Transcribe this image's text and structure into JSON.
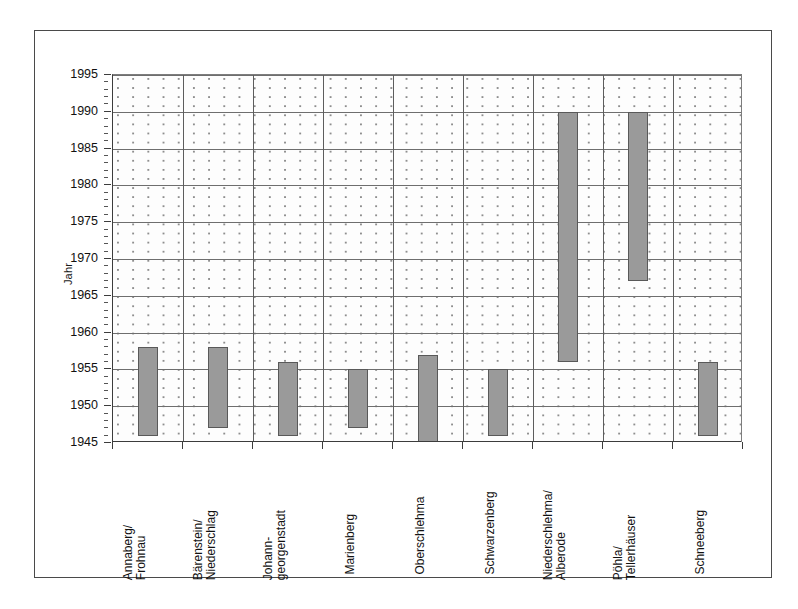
{
  "axes": {
    "y_title": "Jahr",
    "y_ticks": [
      "1995",
      "1990",
      "1985",
      "1980",
      "1975",
      "1970",
      "1965",
      "1960",
      "1955",
      "1950",
      "1945"
    ]
  },
  "categories": [
    "Annaberg/\nFrohnau",
    "Bärenstein/\nNiederschlag",
    "Johann-\ngeorgenstadt",
    "Marienberg",
    "Oberschlehma",
    "Schwarzenberg",
    "Niederschlehma/\nAlberode",
    "Pöhla/\nTellerhäuser",
    "Schneeberg"
  ],
  "chart_data": {
    "type": "bar",
    "orientation": "vertical",
    "title": "",
    "xlabel": "",
    "ylabel": "Jahr",
    "ylim": [
      1945,
      1995
    ],
    "ytick_step": 5,
    "yminor_step": 1,
    "grid": "horizontal-major",
    "legend": "none",
    "value_kind": "range",
    "bar_color": "#9a9a9a",
    "bar_edge_color": "#595959",
    "categories": [
      "Annaberg/Frohnau",
      "Bärenstein/Niederschlag",
      "Johanngeorgenstadt",
      "Marienberg",
      "Oberschlehma",
      "Schwarzenberg",
      "Niederschlehma/Alberode",
      "Pöhla/Tellerhäuser",
      "Schneeberg"
    ],
    "series": [
      {
        "name": "Abbauzeitraum",
        "ranges": [
          {
            "category": "Annaberg/Frohnau",
            "start": 1946,
            "end": 1958
          },
          {
            "category": "Bärenstein/Niederschlag",
            "start": 1947,
            "end": 1958
          },
          {
            "category": "Johanngeorgenstadt",
            "start": 1946,
            "end": 1956
          },
          {
            "category": "Marienberg",
            "start": 1947,
            "end": 1955
          },
          {
            "category": "Oberschlehma",
            "start": 1945,
            "end": 1957
          },
          {
            "category": "Schwarzenberg",
            "start": 1946,
            "end": 1955
          },
          {
            "category": "Niederschlehma/Alberode",
            "start": 1956,
            "end": 1990
          },
          {
            "category": "Pöhla/Tellerhäuser",
            "start": 1967,
            "end": 1990
          },
          {
            "category": "Schneeberg",
            "start": 1946,
            "end": 1956
          }
        ]
      }
    ]
  }
}
